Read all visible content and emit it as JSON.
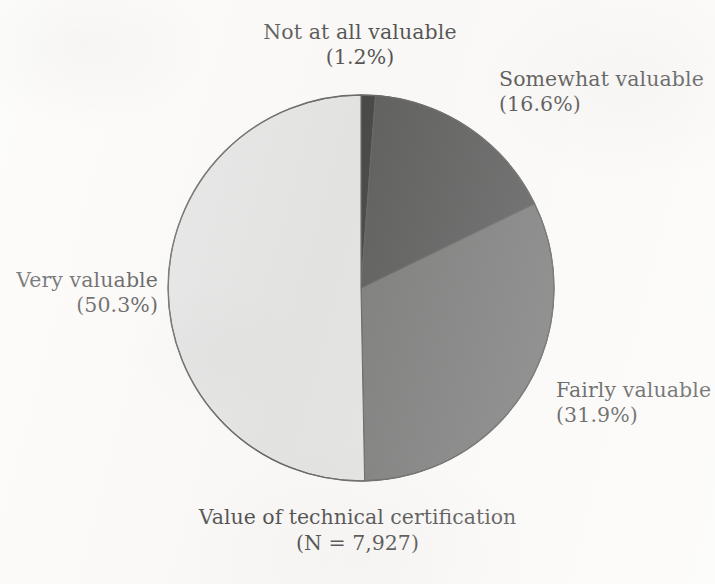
{
  "figure": {
    "caption_title": "Value of technical certification",
    "caption_sub": "(N = 7,927)",
    "background_color": "#faf9f7",
    "text_color": "#1b1b1b"
  },
  "labels": {
    "not_at_all": {
      "name": "Not at all valuable",
      "pct": "(1.2%)"
    },
    "somewhat": {
      "name": "Somewhat valuable",
      "pct": "(16.6%)"
    },
    "fairly": {
      "name": "Fairly valuable",
      "pct": "(31.9%)"
    },
    "very": {
      "name": "Very valuable",
      "pct": "(50.3%)"
    }
  },
  "chart_data": {
    "type": "pie",
    "title": "Value of technical certification",
    "subtitle": "(N = 7,927)",
    "sample_size": 7927,
    "xlabel": "",
    "ylabel": "",
    "grid": false,
    "legend_position": "outside-labels",
    "start_angle_deg": 0,
    "direction": "clockwise",
    "center_px": [
      361,
      288
    ],
    "radius_px": 193,
    "categories": [
      "Not at all valuable",
      "Somewhat valuable",
      "Fairly valuable",
      "Very valuable"
    ],
    "values": [
      1.2,
      16.6,
      31.9,
      50.3
    ],
    "value_unit": "percent",
    "slice_colors": [
      "#101010",
      "#303030",
      "#585858",
      "#dcdcdc"
    ],
    "slice_outline_color": "#3a3a3a",
    "slices": [
      {
        "label": "Not at all valuable",
        "value": 1.2,
        "color": "#101010",
        "label_pct": "(1.2%)"
      },
      {
        "label": "Somewhat valuable",
        "value": 16.6,
        "color": "#303030",
        "label_pct": "(16.6%)"
      },
      {
        "label": "Fairly valuable",
        "value": 31.9,
        "color": "#585858",
        "label_pct": "(31.9%)"
      },
      {
        "label": "Very valuable",
        "value": 50.3,
        "color": "#dcdcdc",
        "label_pct": "(50.3%)"
      }
    ]
  }
}
